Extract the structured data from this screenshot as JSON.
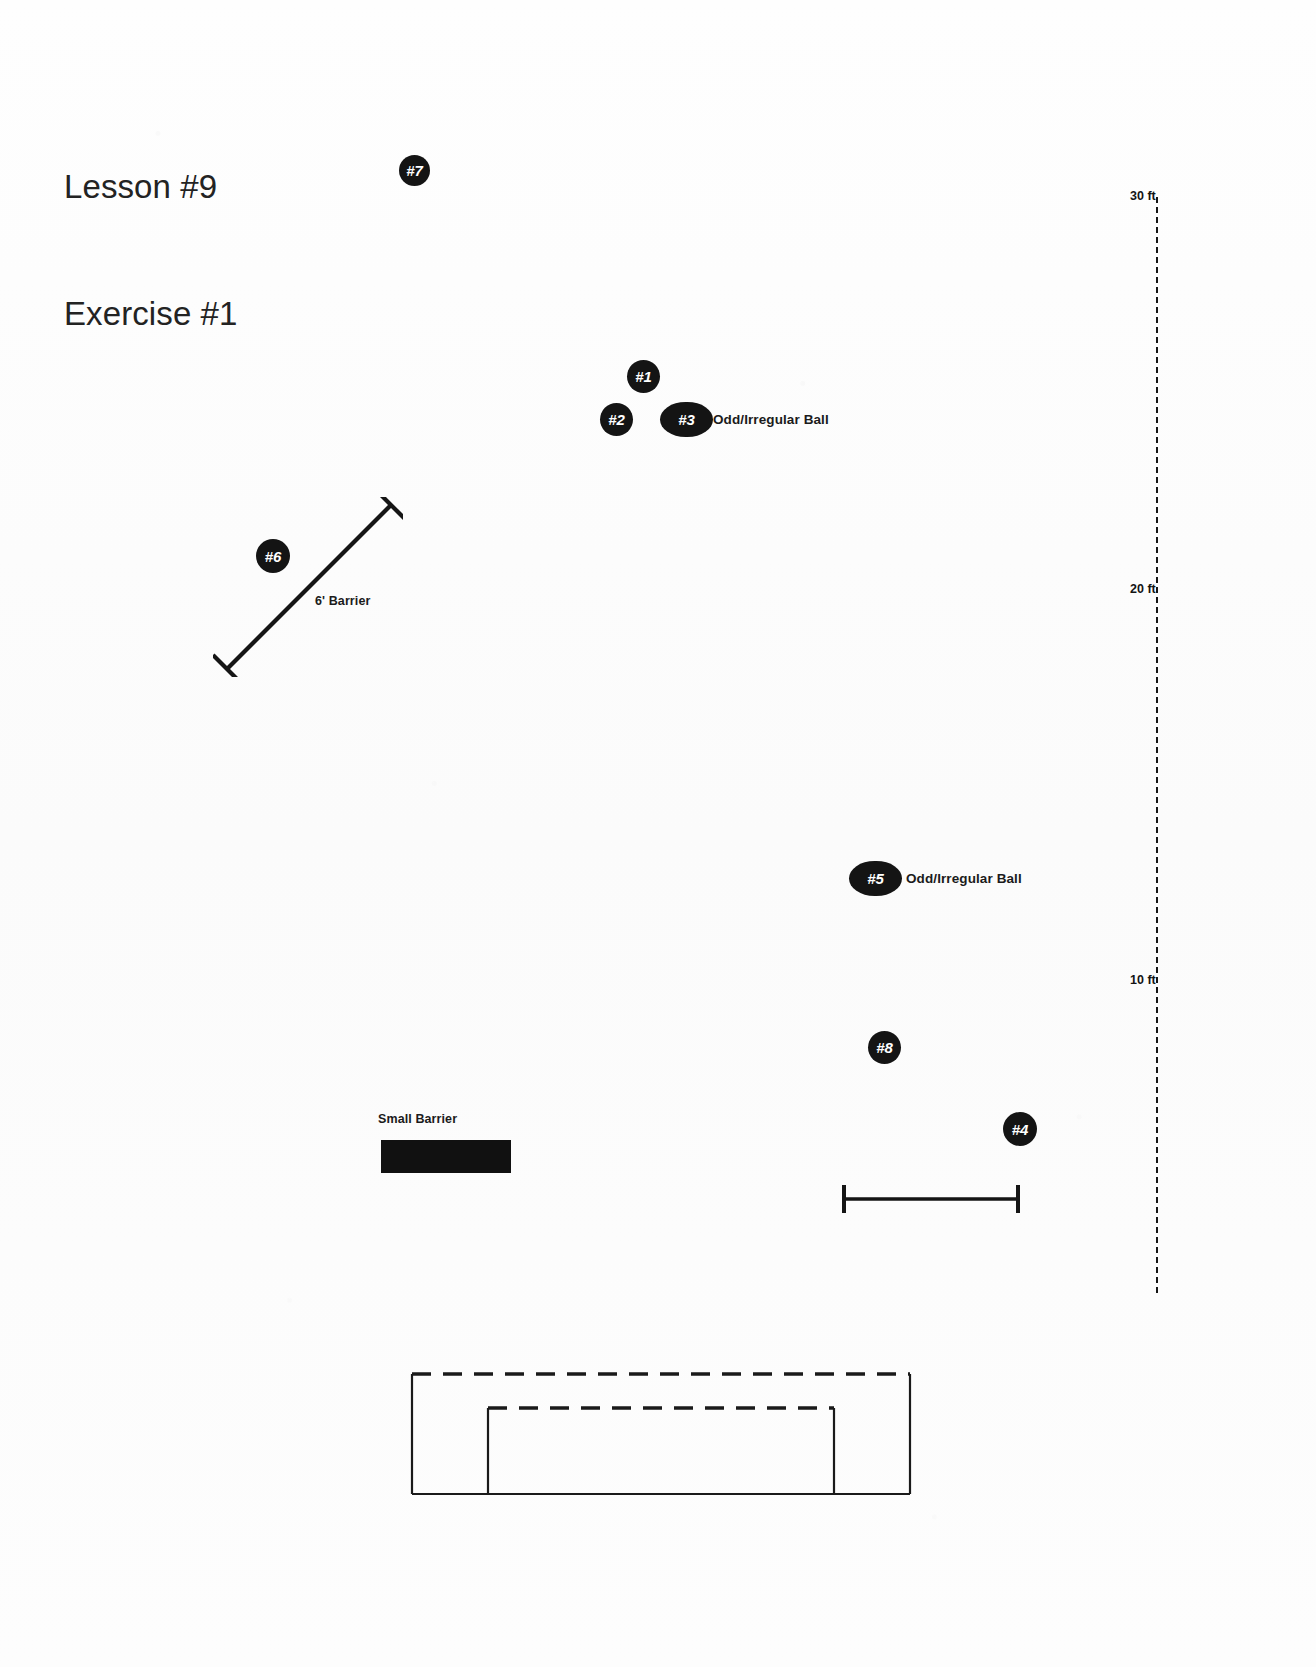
{
  "title": {
    "line1": "Lesson #9",
    "line2": "Exercise #1"
  },
  "markers": [
    {
      "id": "marker-7",
      "label": "#7",
      "x": 399,
      "y": 155,
      "w": 31,
      "h": 31,
      "shape": "circle"
    },
    {
      "id": "marker-1",
      "label": "#1",
      "x": 627,
      "y": 360,
      "w": 33,
      "h": 33,
      "shape": "circle"
    },
    {
      "id": "marker-2",
      "label": "#2",
      "x": 600,
      "y": 403,
      "w": 33,
      "h": 33,
      "shape": "circle"
    },
    {
      "id": "marker-3",
      "label": "#3",
      "x": 660,
      "y": 402,
      "w": 53,
      "h": 35,
      "shape": "oval"
    },
    {
      "id": "marker-6",
      "label": "#6",
      "x": 256,
      "y": 539,
      "w": 34,
      "h": 34,
      "shape": "circle"
    },
    {
      "id": "marker-5",
      "label": "#5",
      "x": 849,
      "y": 861,
      "w": 53,
      "h": 35,
      "shape": "oval"
    },
    {
      "id": "marker-8",
      "label": "#8",
      "x": 868,
      "y": 1031,
      "w": 33,
      "h": 33,
      "shape": "circle"
    },
    {
      "id": "marker-4",
      "label": "#4",
      "x": 1003,
      "y": 1112,
      "w": 34,
      "h": 34,
      "shape": "circle"
    }
  ],
  "field_labels": [
    {
      "id": "label-odd-ball-top",
      "text": "Odd/Irregular Ball",
      "x": 713,
      "y": 412
    },
    {
      "id": "label-odd-ball-mid",
      "text": "Odd/Irregular Ball",
      "x": 906,
      "y": 871
    },
    {
      "id": "label-6ft-barrier",
      "text": "6' Barrier",
      "x": 315,
      "y": 594
    },
    {
      "id": "label-small-barrier",
      "text": "Small Barrier",
      "x": 378,
      "y": 1112
    }
  ],
  "scale": {
    "name": "distance-scale",
    "ticks": [
      {
        "label": "30 ft",
        "y": 11
      },
      {
        "label": "20 ft",
        "y": 404
      },
      {
        "label": "10 ft",
        "y": 795
      }
    ]
  },
  "barriers": {
    "six_foot": {
      "name": "6-foot-barrier",
      "orientation": "diagonal"
    },
    "small": {
      "name": "small-barrier",
      "orientation": "horizontal"
    }
  },
  "measure_bar": {
    "name": "measure-bar"
  },
  "goal": {
    "name": "goal-structure"
  },
  "colors": {
    "ink": "#141414",
    "paper": "#fdfdfd",
    "marker_text": "#ffffff"
  }
}
